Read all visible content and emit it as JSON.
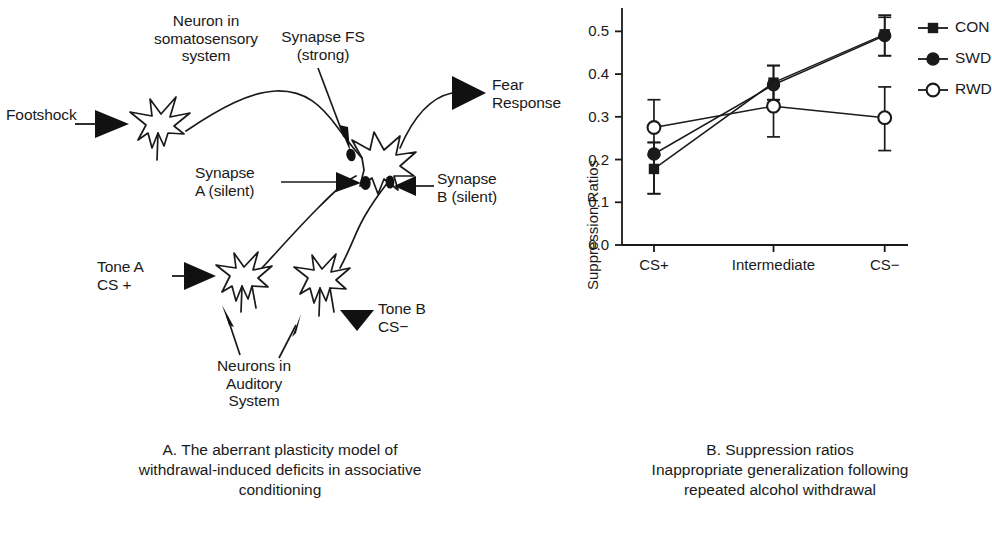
{
  "panel_a": {
    "caption": "A. The aberrant plasticity model of\nwithdrawal-induced deficits in associative\nconditioning",
    "labels": {
      "somatosensory_neuron": "Neuron in\nsomatosensory\nsystem",
      "footshock": "Footshock",
      "synapse_fs": "Synapse FS\n(strong)",
      "fear_response": "Fear\nResponse",
      "synapse_a": "Synapse\nA (silent)",
      "synapse_b": "Synapse\nB (silent)",
      "tone_a": "Tone A\nCS +",
      "tone_b": "Tone B\nCS−",
      "auditory_neurons": "Neurons in\nAuditory\nSystem"
    }
  },
  "panel_b": {
    "caption": "B. Suppression ratios\nInappropriate generalization following\nrepeated alcohol withdrawal"
  },
  "chart_data": {
    "type": "line",
    "title": "",
    "xlabel": "",
    "ylabel": "Suppression Ratios",
    "categories": [
      "CS+",
      "Intermediate",
      "CS−"
    ],
    "xtick_labels": [
      "CS+",
      "Intermediate",
      "CS−"
    ],
    "ytick_labels": [
      "0.0",
      "0.1",
      "0.2",
      "0.3",
      "0.4",
      "0.5"
    ],
    "yticks": [
      0.0,
      0.1,
      0.2,
      0.3,
      0.4,
      0.5
    ],
    "ylim": [
      0.0,
      0.55
    ],
    "grid": false,
    "legend_position": "right",
    "series": [
      {
        "name": "CON",
        "marker": "filled-square",
        "color": "#1a1a1a",
        "values": [
          0.178,
          0.38,
          0.493
        ],
        "err_low": [
          0.058,
          0.04,
          0.05
        ],
        "err_high": [
          0.062,
          0.04,
          0.045
        ]
      },
      {
        "name": "SWD",
        "marker": "filled-circle",
        "color": "#1a1a1a",
        "values": [
          0.213,
          0.375,
          0.49
        ],
        "err_low": [
          0.093,
          0.035,
          0.047
        ],
        "err_high": [
          0.027,
          0.045,
          0.043
        ]
      },
      {
        "name": "RWD",
        "marker": "open-circle",
        "color": "#1a1a1a",
        "values": [
          0.275,
          0.325,
          0.298
        ],
        "err_low": [
          0.065,
          0.072,
          0.077
        ],
        "err_high": [
          0.065,
          0.047,
          0.072
        ]
      }
    ]
  }
}
